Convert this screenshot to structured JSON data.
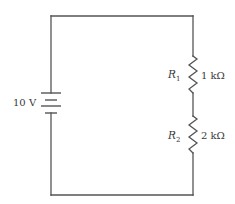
{
  "diagram": {
    "type": "series-circuit",
    "battery": {
      "label": "10 V",
      "voltage_value": "10",
      "voltage_unit": "V"
    },
    "resistors": [
      {
        "name": "R",
        "subscript": "1",
        "value_label": "1 kΩ"
      },
      {
        "name": "R",
        "subscript": "2",
        "value_label": "2 kΩ"
      }
    ],
    "colors": {
      "wire": "#555555",
      "text": "#3a3a3a",
      "background": "#ffffff"
    }
  }
}
